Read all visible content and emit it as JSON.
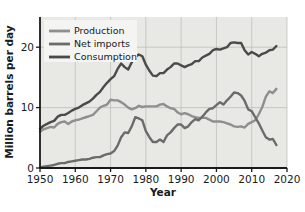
{
  "chart_data": {
    "type": "line",
    "title": "",
    "xlabel": "Year",
    "ylabel": "Million barrels per day",
    "xlim": [
      1950,
      2020
    ],
    "ylim": [
      0,
      25
    ],
    "xticks": [
      1950,
      1960,
      1970,
      1980,
      1990,
      2000,
      2010,
      2020
    ],
    "yticks": [
      0,
      10,
      20
    ],
    "grid": true,
    "legend_position": "top-left",
    "plot_background": "#e8e8e5",
    "series": [
      {
        "name": "Production",
        "color": "#8f8f8f",
        "x": [
          1950,
          1951,
          1952,
          1953,
          1954,
          1955,
          1956,
          1957,
          1958,
          1959,
          1960,
          1961,
          1962,
          1963,
          1964,
          1965,
          1966,
          1967,
          1968,
          1969,
          1970,
          1971,
          1972,
          1973,
          1974,
          1975,
          1976,
          1977,
          1978,
          1979,
          1980,
          1981,
          1982,
          1983,
          1984,
          1985,
          1986,
          1987,
          1988,
          1989,
          1990,
          1991,
          1992,
          1993,
          1994,
          1995,
          1996,
          1997,
          1998,
          1999,
          2000,
          2001,
          2002,
          2003,
          2004,
          2005,
          2006,
          2007,
          2008,
          2009,
          2010,
          2011,
          2012,
          2013,
          2014,
          2015,
          2016,
          2017
        ],
        "values": [
          6.0,
          6.4,
          6.6,
          6.8,
          6.7,
          7.3,
          7.6,
          7.7,
          7.3,
          7.7,
          7.9,
          8.0,
          8.2,
          8.4,
          8.6,
          8.8,
          9.4,
          10.0,
          10.3,
          10.5,
          11.3,
          11.2,
          11.2,
          10.9,
          10.5,
          10.0,
          9.7,
          9.9,
          10.3,
          10.1,
          10.2,
          10.2,
          10.2,
          10.2,
          10.5,
          10.6,
          10.2,
          9.9,
          9.8,
          9.2,
          8.9,
          9.1,
          8.9,
          8.6,
          8.4,
          8.3,
          8.3,
          8.3,
          8.0,
          7.7,
          7.7,
          7.7,
          7.6,
          7.4,
          7.2,
          6.9,
          6.8,
          6.9,
          6.7,
          7.3,
          7.6,
          7.9,
          8.9,
          10.1,
          11.8,
          12.7,
          12.4,
          13.1
        ]
      },
      {
        "name": "Net imports",
        "color": "#6b6b6b",
        "x": [
          1950,
          1951,
          1952,
          1953,
          1954,
          1955,
          1956,
          1957,
          1958,
          1959,
          1960,
          1961,
          1962,
          1963,
          1964,
          1965,
          1966,
          1967,
          1968,
          1969,
          1970,
          1971,
          1972,
          1973,
          1974,
          1975,
          1976,
          1977,
          1978,
          1979,
          1980,
          1981,
          1982,
          1983,
          1984,
          1985,
          1986,
          1987,
          1988,
          1989,
          1990,
          1991,
          1992,
          1993,
          1994,
          1995,
          1996,
          1997,
          1998,
          1999,
          2000,
          2001,
          2002,
          2003,
          2004,
          2005,
          2006,
          2007,
          2008,
          2009,
          2010,
          2011,
          2012,
          2013,
          2014,
          2015,
          2016,
          2017
        ],
        "values": [
          0.1,
          0.2,
          0.3,
          0.4,
          0.5,
          0.7,
          0.8,
          0.8,
          1.0,
          1.1,
          1.2,
          1.3,
          1.4,
          1.4,
          1.5,
          1.7,
          1.8,
          1.8,
          2.1,
          2.3,
          2.4,
          2.8,
          3.7,
          5.1,
          5.9,
          5.8,
          6.9,
          8.4,
          8.2,
          7.9,
          6.1,
          5.1,
          4.3,
          4.3,
          4.7,
          4.3,
          5.4,
          5.9,
          6.6,
          7.2,
          7.2,
          6.6,
          6.9,
          7.6,
          8.1,
          7.9,
          8.5,
          9.2,
          9.8,
          9.9,
          10.4,
          10.9,
          10.5,
          11.2,
          11.8,
          12.5,
          12.4,
          12.0,
          11.1,
          9.7,
          9.4,
          8.4,
          7.4,
          6.2,
          5.1,
          4.7,
          4.8,
          3.8
        ]
      },
      {
        "name": "Consumption",
        "color": "#4a4a4a",
        "x": [
          1950,
          1951,
          1952,
          1953,
          1954,
          1955,
          1956,
          1957,
          1958,
          1959,
          1960,
          1961,
          1962,
          1963,
          1964,
          1965,
          1966,
          1967,
          1968,
          1969,
          1970,
          1971,
          1972,
          1973,
          1974,
          1975,
          1976,
          1977,
          1978,
          1979,
          1980,
          1981,
          1982,
          1983,
          1984,
          1985,
          1986,
          1987,
          1988,
          1989,
          1990,
          1991,
          1992,
          1993,
          1994,
          1995,
          1996,
          1997,
          1998,
          1999,
          2000,
          2001,
          2002,
          2003,
          2004,
          2005,
          2006,
          2007,
          2008,
          2009,
          2010,
          2011,
          2012,
          2013,
          2014,
          2015,
          2016,
          2017
        ],
        "values": [
          6.5,
          7.0,
          7.3,
          7.6,
          7.8,
          8.5,
          8.8,
          8.8,
          9.1,
          9.5,
          9.8,
          10.0,
          10.4,
          10.7,
          11.0,
          11.5,
          12.1,
          12.6,
          13.4,
          14.1,
          14.7,
          15.2,
          16.4,
          17.3,
          16.7,
          16.3,
          17.5,
          18.4,
          18.8,
          18.5,
          17.1,
          16.1,
          15.3,
          15.2,
          15.7,
          15.7,
          16.3,
          16.7,
          17.3,
          17.3,
          17.0,
          16.7,
          17.0,
          17.2,
          17.7,
          17.7,
          18.3,
          18.6,
          18.9,
          19.5,
          19.7,
          19.6,
          19.8,
          20.0,
          20.7,
          20.8,
          20.7,
          20.7,
          19.5,
          18.8,
          19.2,
          18.9,
          18.5,
          18.9,
          19.1,
          19.5,
          19.6,
          20.2
        ]
      }
    ]
  },
  "legend": {
    "items": [
      {
        "label": "Production"
      },
      {
        "label": "Net imports"
      },
      {
        "label": "Consumption"
      }
    ]
  },
  "axes": {
    "ylabel": "Million barrels per day",
    "xlabel": "Year",
    "ytick_labels": [
      "0",
      "10",
      "20"
    ],
    "xtick_labels": [
      "1950",
      "1960",
      "1970",
      "1980",
      "1990",
      "2000",
      "2010",
      "2020"
    ]
  }
}
